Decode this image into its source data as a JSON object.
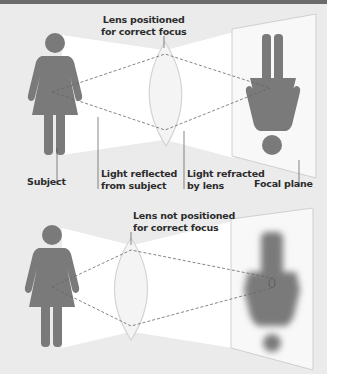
{
  "colors": {
    "top_bar": "#6b6b6b",
    "background": "#ebebeb",
    "beam": "#ffffff",
    "figure": "#7a7a7a",
    "lens_outline": "#d6d6d6",
    "dashed_ray": "#666666",
    "focal_plane": "#f7f7f7",
    "label_text": "#2b2b2b",
    "leader_line": "#555555"
  },
  "top_panel": {
    "lens_label_line1": "Lens positioned",
    "lens_label_line2": "for correct focus",
    "subject_label": "Subject",
    "reflected_label_line1": "Light reflected",
    "reflected_label_line2": "from subject",
    "refracted_label_line1": "Light refracted",
    "refracted_label_line2": "by lens",
    "focal_plane_label": "Focal plane",
    "image_state": "sharp inverted image"
  },
  "bottom_panel": {
    "lens_label_line1": "Lens not positioned",
    "lens_label_line2": "for correct focus",
    "image_state": "blurred inverted image"
  }
}
